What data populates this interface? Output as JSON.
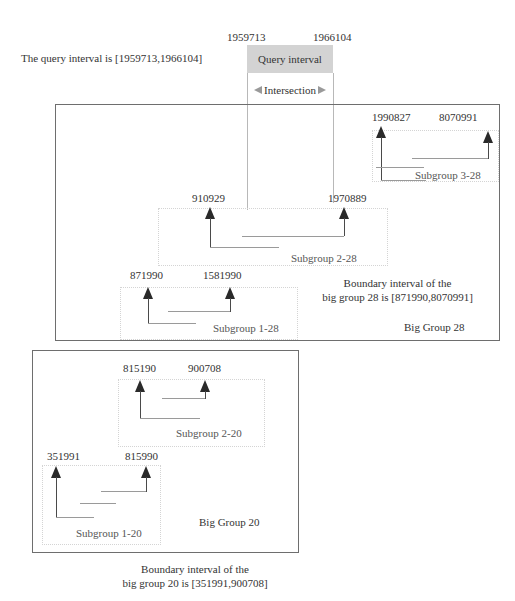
{
  "query": {
    "statement": "The query interval is [1959713,1966104]",
    "start_label": "1959713",
    "end_label": "1966104",
    "box_label": "Query interval",
    "intersection_label": "Intersection"
  },
  "big_group_28": {
    "title": "Big Group 28",
    "boundary_line1": "Boundary  interval  of  the",
    "boundary_line2": "big group  28  is  [871990,8070991]",
    "subgroups": [
      {
        "label": "Subgroup 1-28",
        "start": "871990",
        "end": "1581990"
      },
      {
        "label": "Subgroup 2-28",
        "start": "910929",
        "end": "1970889"
      },
      {
        "label": "Subgroup 3-28",
        "start": "1990827",
        "end": "8070991"
      }
    ]
  },
  "big_group_20": {
    "title": "Big Group 20",
    "boundary_line1": "Boundary  interval  of  the",
    "boundary_line2": "big group  20  is  [351991,900708]",
    "subgroups": [
      {
        "label": "Subgroup 1-20",
        "start": "351991",
        "end": "815990"
      },
      {
        "label": "Subgroup 2-20",
        "start": "815190",
        "end": "900708"
      }
    ]
  },
  "colors": {
    "query_fill": "#d3d3d3",
    "box_border": "#6e6e6e",
    "subgroup_border": "#d4d4d4",
    "arrow": "#2a2a2a"
  }
}
